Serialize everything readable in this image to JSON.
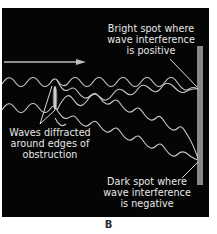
{
  "figure": {
    "panel_label": "B",
    "background_color": "#050505",
    "wave_color": "#c8c8c8",
    "screen_color": "#8a8a8a"
  },
  "labels": {
    "bright_spot": {
      "line1": "Bright spot where",
      "line2": "wave interference",
      "line3": "is positive"
    },
    "diffraction": {
      "line1": "Waves diffracted",
      "line2": "around edges of",
      "line3": "obstruction"
    },
    "dark_spot": {
      "line1": "Dark spot where",
      "line2": "wave interference",
      "line3": "is negative"
    }
  },
  "elements": {
    "incident_arrow": "arrow-right-icon",
    "obstruction": "obstruction-lozenge",
    "screen": "detector-screen"
  }
}
